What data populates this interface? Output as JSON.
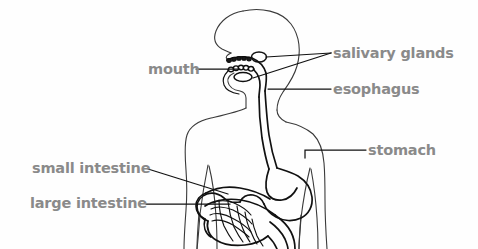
{
  "diagram": {
    "background_color": "#fefefe",
    "label_color": "#8a8a8a",
    "line_color": "#111111",
    "body_outline_color": "#3a3a3a",
    "width": 478,
    "height": 249
  },
  "labels": [
    {
      "id": "salivary-glands",
      "text": "salivary glands",
      "side": "right",
      "x": 333,
      "y": 46,
      "leader": "branched, two lines to glands above and below mouth"
    },
    {
      "id": "esophagus",
      "text": "esophagus",
      "side": "right",
      "x": 333,
      "y": 82,
      "leader": "straight horizontal to throat tube"
    },
    {
      "id": "stomach",
      "text": "stomach",
      "side": "right",
      "x": 368,
      "y": 143,
      "leader": "horizontal then down-left elbow to stomach"
    },
    {
      "id": "mouth",
      "text": "mouth",
      "side": "left",
      "x": 148,
      "y": 62,
      "leader": "straight horizontal to mouth cavity"
    },
    {
      "id": "small-intestine",
      "text": "small intestine",
      "side": "left",
      "x": 32,
      "y": 161,
      "leader": "diagonal down-right to coiled small intestine"
    },
    {
      "id": "large-intestine",
      "text": "large intestine",
      "side": "left",
      "x": 30,
      "y": 196,
      "leader": "straight horizontal to colon loop"
    }
  ],
  "organs": [
    {
      "id": "mouth",
      "name": "mouth"
    },
    {
      "id": "salivary-glands",
      "name": "salivary glands"
    },
    {
      "id": "esophagus",
      "name": "esophagus"
    },
    {
      "id": "stomach",
      "name": "stomach"
    },
    {
      "id": "small-intestine",
      "name": "small intestine"
    },
    {
      "id": "large-intestine",
      "name": "large intestine"
    }
  ],
  "body_parts": [
    {
      "id": "head",
      "name": "head profile"
    },
    {
      "id": "neck",
      "name": "neck"
    },
    {
      "id": "torso",
      "name": "torso and shoulders"
    },
    {
      "id": "arms",
      "name": "arms"
    }
  ]
}
